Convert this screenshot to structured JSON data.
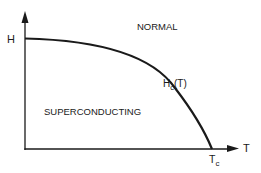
{
  "diagram": {
    "axes": {
      "y_label": "H",
      "x_label": "T"
    },
    "curve": {
      "label_main": "H",
      "label_sub": "c",
      "label_suffix": "(T)"
    },
    "regions": {
      "upper": "NORMAL",
      "lower": "SUPERCONDUCTING"
    },
    "x_marker": {
      "label_main": "T",
      "label_sub": "c"
    },
    "colors": {
      "ink": "#1a1a1a",
      "background": "#ffffff"
    }
  }
}
